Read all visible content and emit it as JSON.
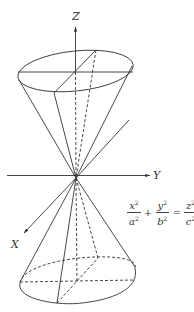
{
  "diagram": {
    "axes": {
      "z_label": "Z",
      "y_label": "Y",
      "x_label": "X"
    },
    "equation": {
      "terms": [
        {
          "num_var": "x",
          "num_exp": "2",
          "den_var": "a",
          "den_exp": "2"
        },
        {
          "num_var": "y",
          "num_exp": "2",
          "den_var": "b",
          "den_exp": "2"
        },
        {
          "num_var": "z",
          "num_exp": "2",
          "den_var": "c",
          "den_exp": "2"
        }
      ],
      "plus": "+",
      "equals": "="
    },
    "colors": {
      "line": "#333333",
      "background": "#ffffff"
    }
  }
}
